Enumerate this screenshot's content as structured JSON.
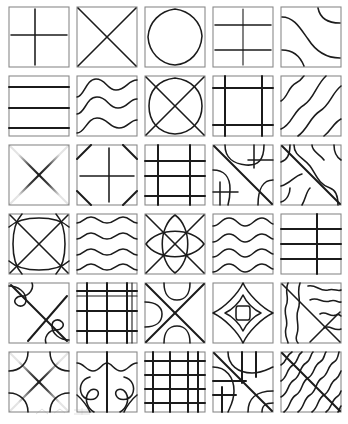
{
  "document": {
    "title": "Line Pattern Tile Sheet",
    "background_color": "#ffffff",
    "ink_color": "#1b1b1b",
    "frame_color": "#8a8a8a",
    "width": 348,
    "height": 424
  },
  "grid": {
    "rows": 6,
    "columns": 5,
    "tile_size": 62,
    "column_gap": 6,
    "row_gap": 7,
    "origin_x": 8,
    "origin_y": 6,
    "total_tiles": 30
  },
  "tiles": [
    {
      "id": "r1c1",
      "row": 1,
      "col": 1,
      "name": "plus-cross-starburst",
      "description": "Soft-edged vertical and horizontal cross meeting at center, airbrush falloff",
      "motif": "cross",
      "symmetry": "4-fold",
      "line_count": 2
    },
    {
      "id": "r1c2",
      "row": 1,
      "col": 2,
      "name": "corner-to-corner-x",
      "description": "Two diagonals from corner to corner forming a bold X",
      "motif": "diagonal-x",
      "symmetry": "4-fold",
      "line_count": 2
    },
    {
      "id": "r1c3",
      "row": 1,
      "col": 3,
      "name": "rounded-diamond-squircle",
      "description": "Single closed rounded-diamond loop touching the midpoints of all four edges",
      "motif": "closed-loop",
      "symmetry": "4-fold",
      "line_count": 1
    },
    {
      "id": "r1c4",
      "row": 1,
      "col": 4,
      "name": "stacked-double-cross",
      "description": "Two soft airbrushed crosses stacked vertically on a shared vertical axis",
      "motif": "cross",
      "symmetry": "vertical-mirror",
      "line_count": 3
    },
    {
      "id": "r1c5",
      "row": 1,
      "col": 5,
      "name": "s-curve-sweeps",
      "description": "Long diagonal S-curve with two short mirrored corner arcs",
      "motif": "wave",
      "symmetry": "point",
      "line_count": 3
    },
    {
      "id": "r2c1",
      "row": 2,
      "col": 1,
      "name": "horizontal-bands",
      "description": "Three straight horizontal lines dividing the square into four bands",
      "motif": "stripes",
      "symmetry": "horizontal-mirror",
      "line_count": 3
    },
    {
      "id": "r2c2",
      "row": 2,
      "col": 2,
      "name": "triple-sine-waves",
      "description": "Three large-amplitude horizontal sine waves",
      "motif": "wave",
      "symmetry": "horizontal-repeat",
      "line_count": 3
    },
    {
      "id": "r2c3",
      "row": 2,
      "col": 3,
      "name": "oval-over-x",
      "description": "Rounded square loop overlaid by a corner-to-corner diagonal X",
      "motif": "loop-plus-x",
      "symmetry": "4-fold",
      "line_count": 3
    },
    {
      "id": "r2c4",
      "row": 2,
      "col": 4,
      "name": "double-border-lattice",
      "description": "Inset rectangular lattice: two verticals and two horizontals forming a frame within the frame",
      "motif": "grid",
      "symmetry": "4-fold",
      "line_count": 4
    },
    {
      "id": "r2c5",
      "row": 2,
      "col": 5,
      "name": "diagonal-wave-field",
      "description": "Parallel diagonal S-waves running lower-left to upper-right",
      "motif": "diagonal-wave",
      "symmetry": "translational",
      "line_count": 4
    },
    {
      "id": "r3c1",
      "row": 3,
      "col": 1,
      "name": "eight-point-starburst",
      "description": "Eight rays radiating from the centre: verticals, horizontals and both diagonals",
      "motif": "star",
      "symmetry": "8-fold",
      "line_count": 4
    },
    {
      "id": "r3c2",
      "row": 3,
      "col": 2,
      "name": "cross-with-clipped-corners",
      "description": "Faint centre cross with four bold diagonal corner chamfer strokes",
      "motif": "cross-and-corners",
      "symmetry": "4-fold",
      "line_count": 6
    },
    {
      "id": "r3c3",
      "row": 3,
      "col": 3,
      "name": "offset-plaid-grid",
      "description": "Plaid of two horizontals and two verticals placed off centre",
      "motif": "grid",
      "symmetry": "none",
      "line_count": 4
    },
    {
      "id": "r3c4",
      "row": 3,
      "col": 4,
      "name": "diagonal-with-corner-hooks",
      "description": "Main corner diagonal with quarter-round hooks and short grid ticks in opposite corners",
      "motif": "diagonal-mixed",
      "symmetry": "point",
      "line_count": 7
    },
    {
      "id": "r3c5",
      "row": 3,
      "col": 5,
      "name": "diagonal-band-with-waves",
      "description": "Bold main diagonal flanked by parallel wavy strokes on both sides",
      "motif": "diagonal-wave",
      "symmetry": "point",
      "line_count": 6
    },
    {
      "id": "r4c1",
      "row": 4,
      "col": 1,
      "name": "woven-diamond-lattice",
      "description": "Corner X overlaid with two bulging arcs creating a woven diamond",
      "motif": "weave",
      "symmetry": "4-fold",
      "line_count": 4
    },
    {
      "id": "r4c2",
      "row": 4,
      "col": 2,
      "name": "four-ripple-waves",
      "description": "Four low-amplitude horizontal ripple lines",
      "motif": "wave",
      "symmetry": "horizontal-repeat",
      "line_count": 4
    },
    {
      "id": "r4c3",
      "row": 4,
      "col": 3,
      "name": "double-ellipse-cross",
      "description": "Two tall crossing ellipses forming a pointed oval lattice with an X",
      "motif": "weave",
      "symmetry": "4-fold",
      "line_count": 4
    },
    {
      "id": "r4c4",
      "row": 4,
      "col": 4,
      "name": "dense-ripple-bands",
      "description": "Four tight horizontal ripples paired into two bands",
      "motif": "wave",
      "symmetry": "horizontal-repeat",
      "line_count": 4
    },
    {
      "id": "r4c5",
      "row": 4,
      "col": 5,
      "name": "ruled-rows-single-column",
      "description": "Three horizontal rules crossed by one vertical rule right of centre",
      "motif": "grid",
      "symmetry": "none",
      "line_count": 4
    },
    {
      "id": "r5c1",
      "row": 5,
      "col": 1,
      "name": "x-with-blob-lobes",
      "description": "Corner X with two rounded blob lobes tucked into opposite corners",
      "motif": "diagonal-and-blob",
      "symmetry": "point",
      "line_count": 4
    },
    {
      "id": "r5c2",
      "row": 5,
      "col": 2,
      "name": "dense-plaid-grid",
      "description": "Dense plaid: three verticals and three horizontals, unevenly spaced",
      "motif": "grid",
      "symmetry": "none",
      "line_count": 6
    },
    {
      "id": "r5c3",
      "row": 5,
      "col": 3,
      "name": "x-with-edge-semicircles",
      "description": "Bold corner X with semicircular bites on the top, bottom and left edges",
      "motif": "diagonal-and-arc",
      "symmetry": "4-fold",
      "line_count": 5
    },
    {
      "id": "r5c4",
      "row": 5,
      "col": 4,
      "name": "concentric-rounded-diamonds",
      "description": "Three nested rounded-diamond contours shrinking to a small rounded square core",
      "motif": "concentric",
      "symmetry": "4-fold",
      "line_count": 3
    },
    {
      "id": "r5c5",
      "row": 5,
      "col": 5,
      "name": "wave-field-over-x",
      "description": "Vertical wavy contour field crossed by a diagonal X",
      "motif": "wave-and-x",
      "symmetry": "none",
      "line_count": 7
    },
    {
      "id": "r6c1",
      "row": 6,
      "col": 1,
      "name": "starburst-with-arcs",
      "description": "Eight-ray starburst overlaid with four curved corner arcs",
      "motif": "star-and-arc",
      "symmetry": "4-fold",
      "line_count": 8
    },
    {
      "id": "r6c2",
      "row": 6,
      "col": 2,
      "name": "split-panel-hooks",
      "description": "Central vertical divider with mirrored hook curves and crossing tails in each half",
      "motif": "mirror-hooks",
      "symmetry": "vertical-mirror",
      "line_count": 7
    },
    {
      "id": "r6c3",
      "row": 6,
      "col": 3,
      "name": "fine-mesh-grid",
      "description": "Fine mesh: four verticals and four horizontals, tightly ruled",
      "motif": "grid",
      "symmetry": "near-uniform",
      "line_count": 8
    },
    {
      "id": "r6c4",
      "row": 6,
      "col": 4,
      "name": "diagonal-over-rounded-grid",
      "description": "Main diagonal crossing a rounded-corner grid of hooks and rules",
      "motif": "diagonal-and-grid",
      "symmetry": "point",
      "line_count": 9
    },
    {
      "id": "r6c5",
      "row": 6,
      "col": 5,
      "name": "dense-diagonal-squiggles",
      "description": "Dense field of parallel diagonal squiggle lines with a bold straight diagonal",
      "motif": "diagonal-wave",
      "symmetry": "translational",
      "line_count": 9
    }
  ],
  "artifacts": {
    "bottom_smudge": "faint scanner speckle below the grid"
  }
}
